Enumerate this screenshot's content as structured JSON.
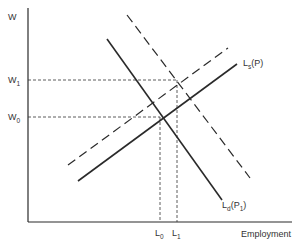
{
  "diagram": {
    "type": "labor-market-supply-demand",
    "y_axis_label": "W",
    "x_axis_label": "Employment",
    "wage_levels": [
      {
        "label": "W",
        "sub": "1",
        "y": 80
      },
      {
        "label": "W",
        "sub": "0",
        "y": 117
      }
    ],
    "employment_levels": [
      {
        "label": "L",
        "sub": "0",
        "x": 160
      },
      {
        "label": "L",
        "sub": "1",
        "x": 177
      }
    ],
    "curves": [
      {
        "name": "labor-supply",
        "label": "L",
        "sub": "s",
        "suffix": "(P)",
        "style": "solid",
        "from": [
          78,
          181
        ],
        "to": [
          237,
          64
        ]
      },
      {
        "name": "labor-supply-shifted",
        "label": "",
        "style": "dashed",
        "from": [
          68,
          165
        ],
        "to": [
          228,
          48
        ]
      },
      {
        "name": "labor-demand",
        "label": "L",
        "sub": "d",
        "suffix": "(P",
        "suffix_sub": "1",
        "suffix_end": ")",
        "style": "solid",
        "from": [
          107,
          39
        ],
        "to": [
          222,
          200
        ]
      },
      {
        "name": "labor-demand-shifted",
        "label": "",
        "style": "dashed",
        "from": [
          127,
          15
        ],
        "to": [
          250,
          178
        ]
      }
    ],
    "colors": {
      "line": "#2a2a2a",
      "background": "#ffffff"
    }
  }
}
